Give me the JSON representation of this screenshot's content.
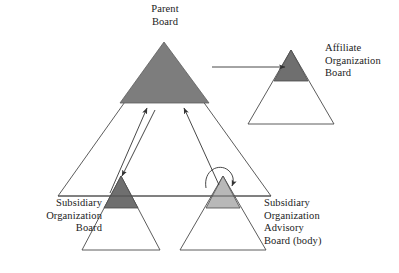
{
  "diagram": {
    "type": "organization-structure-triangles",
    "background_color": "#ffffff",
    "stroke_color": "#3a3a3a",
    "colors": {
      "parent_fill": "#7d7d7d",
      "affiliate_apex_fill": "#6f6f6f",
      "subsidiary_apex_fill": "#6f6f6f",
      "advisory_apex_fill": "#b8b8b8",
      "outline_fill": "#ffffff"
    },
    "nodes": [
      {
        "id": "parent",
        "label": "Parent\nBoard",
        "label_align": "center",
        "shape": "filled-triangle",
        "fill": "#7d7d7d"
      },
      {
        "id": "affiliate",
        "label": "Affiliate\nOrganization\nBoard",
        "label_align": "left",
        "shape": "outline-triangle-with-dark-apex",
        "apex_fill": "#6f6f6f"
      },
      {
        "id": "subsidiary",
        "label": "Subsidiary\nOrganization\nBoard",
        "label_align": "right",
        "shape": "outline-triangle-with-dark-apex",
        "apex_fill": "#6f6f6f"
      },
      {
        "id": "subsidiary-advisory",
        "label": "Subsidiary\nOrganization\nAdvisory\nBoard (body)",
        "label_align": "left",
        "shape": "outline-triangle-with-light-apex",
        "apex_fill": "#b8b8b8"
      }
    ],
    "connectors": [
      {
        "id": "parent-to-affiliate",
        "style": "straight-arrow",
        "direction": "right"
      },
      {
        "id": "subsidiary-to-parent",
        "style": "straight-arrow",
        "direction": "up"
      },
      {
        "id": "advisory-to-parent",
        "style": "straight-arrow",
        "direction": "up"
      },
      {
        "id": "parent-to-subsidiary",
        "style": "straight-arrow",
        "direction": "down"
      },
      {
        "id": "advisory-self-loop",
        "style": "curved-loop-arrow",
        "direction": "clockwise"
      }
    ]
  }
}
